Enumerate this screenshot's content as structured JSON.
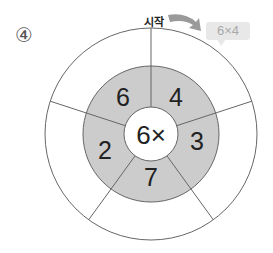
{
  "problem": {
    "number_label": "④",
    "start_label": "시작",
    "example_bubble": "6×4"
  },
  "wheel": {
    "center_label": "6×",
    "inner_numbers": [
      "4",
      "3",
      "7",
      "2",
      "6"
    ],
    "outer_answers": [
      "",
      "",
      "",
      "",
      ""
    ],
    "colors": {
      "ring_fill": "#cccccc",
      "stroke": "#666666",
      "center_fill": "#ffffff",
      "bubble_bg": "#e8e8e8",
      "arrow": "#9a9a9a"
    }
  }
}
